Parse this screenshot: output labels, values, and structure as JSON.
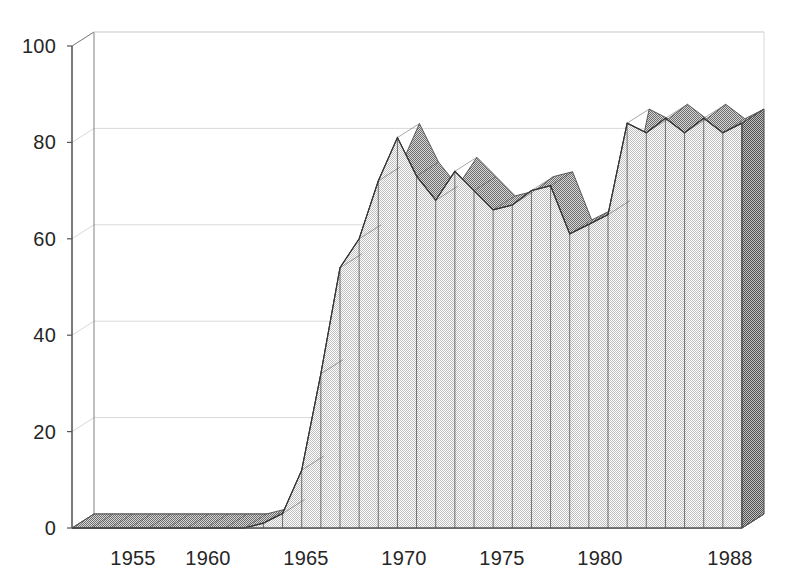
{
  "chart_data": {
    "type": "area",
    "title": "",
    "subtitle": "",
    "xlabel": "",
    "ylabel": "",
    "style": "3d-ribbon-area",
    "grid": true,
    "legend": null,
    "xlim": [
      1953,
      1988
    ],
    "ylim": [
      0,
      100
    ],
    "y_ticks": [
      0,
      20,
      40,
      60,
      80,
      100
    ],
    "y_tick_labels": [
      "0",
      "20",
      "40",
      "60",
      "80",
      "100"
    ],
    "x_ticks": [
      1955,
      1960,
      1965,
      1970,
      1975,
      1980,
      1988
    ],
    "x_tick_labels": [
      "1955",
      "1960",
      "1965",
      "1970",
      "1975",
      "1980",
      "1988"
    ],
    "x": [
      1953,
      1954,
      1955,
      1956,
      1957,
      1958,
      1959,
      1960,
      1961,
      1962,
      1963,
      1964,
      1965,
      1966,
      1967,
      1968,
      1969,
      1970,
      1971,
      1972,
      1973,
      1974,
      1975,
      1976,
      1977,
      1978,
      1979,
      1980,
      1981,
      1982,
      1983,
      1984,
      1985,
      1986,
      1987,
      1988
    ],
    "values": [
      0,
      0,
      0,
      0,
      0,
      0,
      0,
      0,
      0,
      0,
      1,
      3,
      12,
      32,
      54,
      60,
      72,
      81,
      73,
      68,
      74,
      70,
      66,
      67,
      70,
      71,
      61,
      63,
      65,
      84,
      82,
      85,
      82,
      85,
      82,
      84
    ],
    "series": [
      {
        "name": "series-1",
        "values": [
          0,
          0,
          0,
          0,
          0,
          0,
          0,
          0,
          0,
          0,
          1,
          3,
          12,
          32,
          54,
          60,
          72,
          81,
          73,
          68,
          74,
          70,
          66,
          67,
          70,
          71,
          61,
          63,
          65,
          84,
          82,
          85,
          82,
          85,
          82,
          84
        ]
      }
    ],
    "colors": {
      "area_fill": "#e6e6e6",
      "top_ribbon": "#b3b3b3",
      "side_face": "#808080",
      "outline": "#4d4d4d",
      "grid": "#d9d9d9",
      "axis": "#808080",
      "text": "#262626",
      "background": "#ffffff"
    }
  },
  "axes": {
    "y_labels": [
      {
        "text": "100",
        "value": 100
      },
      {
        "text": "80",
        "value": 80
      },
      {
        "text": "60",
        "value": 60
      },
      {
        "text": "40",
        "value": 40
      },
      {
        "text": "20",
        "value": 20
      },
      {
        "text": "0",
        "value": 0
      }
    ],
    "x_labels": [
      {
        "text": "1955",
        "value": 1955
      },
      {
        "text": "1960",
        "value": 1960
      },
      {
        "text": "1965",
        "value": 1965
      },
      {
        "text": "1970",
        "value": 1970
      },
      {
        "text": "1975",
        "value": 1975
      },
      {
        "text": "1980",
        "value": 1980
      },
      {
        "text": "1988",
        "value": 1988
      }
    ]
  }
}
